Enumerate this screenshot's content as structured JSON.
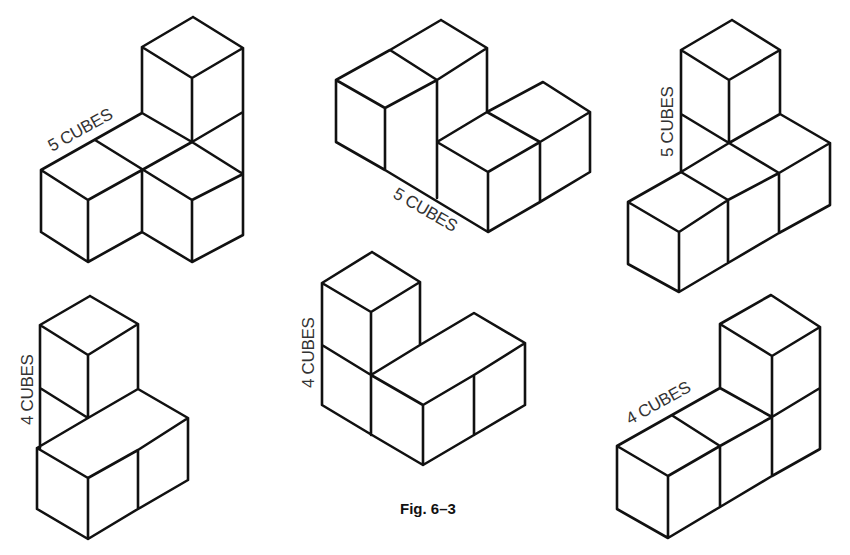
{
  "caption": "Fig. 6–3",
  "figures": [
    {
      "id": "fig-a",
      "label": "5 CUBES",
      "cube_count": 5
    },
    {
      "id": "fig-b",
      "label": "5 CUBES",
      "cube_count": 5
    },
    {
      "id": "fig-c",
      "label": "5 CUBES",
      "cube_count": 5
    },
    {
      "id": "fig-d",
      "label": "4 CUBES",
      "cube_count": 4
    },
    {
      "id": "fig-e",
      "label": "4 CUBES",
      "cube_count": 4
    },
    {
      "id": "fig-f",
      "label": "4 CUBES",
      "cube_count": 4
    }
  ],
  "colors": {
    "line": "#111111",
    "label": "#333333",
    "background": "#ffffff"
  }
}
